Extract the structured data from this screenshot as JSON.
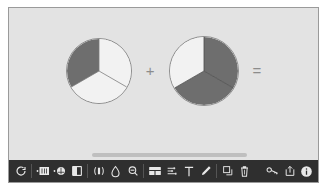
{
  "window": {
    "title": "Fraction Pie Comparison Canvas"
  },
  "canvas": {
    "background_color": "#e3e3e3",
    "operators": [
      {
        "name": "plus",
        "symbol": "+"
      },
      {
        "name": "equals",
        "symbol": "="
      }
    ],
    "colors": {
      "light_slice": "#f2f2f2",
      "dark_slice": "#6e6e6e",
      "outline": "#8d8d8d",
      "separator": "#7a7a7a"
    }
  },
  "chart_data": [
    {
      "type": "pie",
      "name": "pie-chart-left",
      "title": "",
      "categories": [
        "Slice 1",
        "Slice 2",
        "Slice 3"
      ],
      "values": [
        1,
        1,
        1
      ],
      "fractions": [
        "1/3",
        "1/3",
        "1/3"
      ],
      "angles_deg": [
        120,
        120,
        120
      ],
      "start_angle_deg": 0,
      "slice_fills": [
        "#f2f2f2",
        "#f2f2f2",
        "#6e6e6e"
      ],
      "shaded_count": 1,
      "legend": "none",
      "grid": false
    },
    {
      "type": "pie",
      "name": "pie-chart-right",
      "title": "",
      "categories": [
        "Slice 1",
        "Slice 2",
        "Slice 3"
      ],
      "values": [
        1,
        1,
        1
      ],
      "fractions": [
        "1/3",
        "1/3",
        "1/3"
      ],
      "angles_deg": [
        120,
        120,
        120
      ],
      "start_angle_deg": 0,
      "slice_fills": [
        "#6e6e6e",
        "#6e6e6e",
        "#f2f2f2"
      ],
      "shaded_count": 2,
      "legend": "none",
      "grid": false
    }
  ],
  "scrollbar": {
    "orientation": "horizontal",
    "thumb_position_pct": 27,
    "thumb_width_pct": 50
  },
  "toolbar": {
    "background_color": "#2f2f2f",
    "groups": [
      {
        "name": "transform-group",
        "items": [
          {
            "name": "rotate-icon",
            "label": "Rotate",
            "icon": "rotate"
          }
        ]
      },
      {
        "name": "insert-group",
        "items": [
          {
            "name": "add-rectangle-icon",
            "label": "Add Rectangle",
            "icon": "add-rect"
          },
          {
            "name": "add-circle-icon",
            "label": "Add Circle",
            "icon": "add-circle"
          },
          {
            "name": "fill-half-icon",
            "label": "Fill Half",
            "icon": "half-fill"
          }
        ]
      },
      {
        "name": "measure-group",
        "items": [
          {
            "name": "mirror-icon",
            "label": "Mirror",
            "icon": "mirror"
          },
          {
            "name": "droplet-icon",
            "label": "Color Fill",
            "icon": "droplet"
          },
          {
            "name": "zoom-icon",
            "label": "Zoom",
            "icon": "zoom"
          }
        ]
      },
      {
        "name": "layout-group",
        "items": [
          {
            "name": "grid-icon",
            "label": "Grid",
            "icon": "grid"
          },
          {
            "name": "align-icon",
            "label": "Align",
            "icon": "align"
          },
          {
            "name": "text-icon",
            "label": "Text",
            "icon": "text"
          },
          {
            "name": "pencil-icon",
            "label": "Draw",
            "icon": "pencil"
          }
        ]
      },
      {
        "name": "edit-group",
        "items": [
          {
            "name": "duplicate-icon",
            "label": "Duplicate",
            "icon": "duplicate"
          },
          {
            "name": "delete-icon",
            "label": "Delete",
            "icon": "trash"
          }
        ]
      },
      {
        "name": "utility-group",
        "items": [
          {
            "name": "key-icon",
            "label": "Key",
            "icon": "key"
          },
          {
            "name": "export-icon",
            "label": "Export",
            "icon": "export"
          },
          {
            "name": "info-icon",
            "label": "Info",
            "icon": "info"
          }
        ]
      }
    ]
  }
}
